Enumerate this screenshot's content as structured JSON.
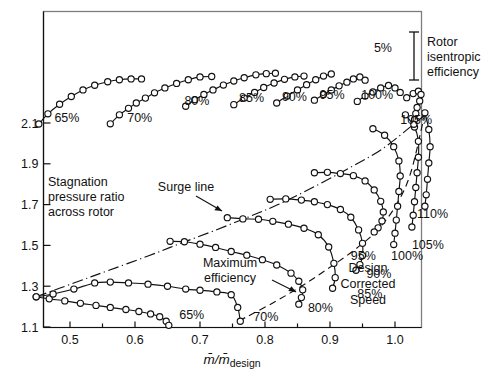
{
  "figure": {
    "xlabel": "m̄/m̄design",
    "xlabel_main": "m̄/m̄",
    "xlabel_sub": "design",
    "ylabel_line1": "Stagnation",
    "ylabel_line2": "pressure ratio",
    "ylabel_line3": "across rotor",
    "legend_line1": "Rotor",
    "legend_line2": "isentropic",
    "legend_line3": "efficiency",
    "eff_scale_label": "5%",
    "surge_label": "Surge line",
    "maxeff_line1": "Maximum",
    "maxeff_line2": "efficiency",
    "design_line1": "Design",
    "design_line2": "Corrected",
    "design_line3": "Speed"
  },
  "chart_data": {
    "type": "line",
    "xlabel": "m̄/m̄design",
    "ylabel": "Stagnation pressure ratio across rotor",
    "xlim": [
      0.44,
      1.06
    ],
    "ylim": [
      1.1,
      2.2
    ],
    "xticks": [
      0.5,
      0.6,
      0.7,
      0.8,
      0.9,
      1.0
    ],
    "xtick_labels": [
      "0.5",
      "0.6",
      "0.7",
      "0.8",
      "0.9",
      "1.0"
    ],
    "xminorticks": [
      0.45,
      0.55,
      0.65,
      0.75,
      0.85,
      0.95,
      1.05
    ],
    "yticks": [
      1.1,
      1.3,
      1.5,
      1.7,
      1.9,
      2.1
    ],
    "ytick_labels": [
      "1.1",
      "1.3",
      "1.5",
      "1.7",
      "1.9",
      "2.1"
    ],
    "grid": false,
    "legend_position": "top-right",
    "speed_lines": [
      {
        "name": "65%",
        "label": "65%",
        "label_xy": [
          0.668,
          1.138
        ],
        "x": [
          0.448,
          0.468,
          0.492,
          0.516,
          0.54,
          0.562,
          0.586,
          0.606,
          0.624,
          0.638,
          0.648,
          0.652
        ],
        "y": [
          1.248,
          1.238,
          1.228,
          1.216,
          1.206,
          1.196,
          1.186,
          1.176,
          1.164,
          1.15,
          1.128,
          1.108
        ]
      },
      {
        "name": "70%",
        "label": "70%",
        "label_xy": [
          0.782,
          1.132
        ],
        "x": [
          0.448,
          0.474,
          0.506,
          0.538,
          0.562,
          0.59,
          0.62,
          0.65,
          0.678,
          0.7,
          0.726,
          0.748,
          0.758,
          0.762
        ],
        "y": [
          1.248,
          1.262,
          1.286,
          1.316,
          1.32,
          1.316,
          1.31,
          1.3,
          1.286,
          1.28,
          1.272,
          1.258,
          1.196,
          1.128
        ]
      },
      {
        "name": "80%",
        "label": "80%",
        "label_xy": [
          0.866,
          1.176
        ],
        "x": [
          0.654,
          0.676,
          0.7,
          0.724,
          0.748,
          0.772,
          0.796,
          0.818,
          0.84,
          0.852,
          0.858,
          0.856,
          0.852
        ],
        "y": [
          1.52,
          1.518,
          1.506,
          1.49,
          1.47,
          1.452,
          1.43,
          1.404,
          1.364,
          1.324,
          1.282,
          1.244,
          1.212
        ]
      },
      {
        "name": "85%",
        "label": "85%",
        "label_xy": [
          0.942,
          1.244
        ],
        "x": [
          0.742,
          0.766,
          0.79,
          0.812,
          0.836,
          0.86,
          0.882,
          0.898,
          0.906,
          0.908,
          0.904
        ],
        "y": [
          1.636,
          1.63,
          1.628,
          1.618,
          1.604,
          1.584,
          1.552,
          1.492,
          1.412,
          1.342,
          1.29
        ]
      },
      {
        "name": "90%",
        "label": "90%",
        "label_xy": [
          0.956,
          1.338
        ],
        "x": [
          0.808,
          0.832,
          0.856,
          0.876,
          0.896,
          0.916,
          0.932,
          0.944,
          0.95,
          0.95,
          0.946,
          0.94
        ],
        "y": [
          1.726,
          1.728,
          1.722,
          1.714,
          1.7,
          1.676,
          1.638,
          1.576,
          1.51,
          1.45,
          1.406,
          1.378
        ]
      },
      {
        "name": "95%",
        "label": "95%",
        "label_xy": [
          0.932,
          1.428
        ],
        "x": [
          0.876,
          0.896,
          0.916,
          0.936,
          0.954,
          0.968,
          0.978,
          0.982,
          0.98,
          0.974,
          0.968
        ],
        "y": [
          1.856,
          1.858,
          1.852,
          1.842,
          1.816,
          1.772,
          1.716,
          1.664,
          1.62,
          1.586,
          1.566
        ]
      },
      {
        "name": "100%",
        "label": "100%",
        "label_xy": [
          0.994,
          1.43
        ],
        "x": [
          0.966,
          0.984,
          0.998,
          1.006,
          1.008,
          1.006,
          1.004,
          1.002,
          1.0,
          0.998
        ],
        "y": [
          2.072,
          2.04,
          1.984,
          1.914,
          1.84,
          1.764,
          1.692,
          1.624,
          1.56,
          1.504
        ]
      },
      {
        "name": "105%",
        "label": "105%",
        "label_xy": [
          1.026,
          1.482
        ],
        "x": [
          1.016,
          1.03,
          1.036,
          1.036,
          1.034,
          1.032,
          1.03,
          1.028,
          1.026
        ],
        "y": [
          2.14,
          2.08,
          2.01,
          1.932,
          1.856,
          1.784,
          1.714,
          1.648,
          1.59
        ]
      },
      {
        "name": "110%",
        "label": "110%",
        "label_xy": [
          1.034,
          1.636
        ],
        "x": [
          1.046,
          1.052,
          1.054,
          1.052,
          1.05,
          1.048,
          1.046
        ],
        "y": [
          2.15,
          2.068,
          1.984,
          1.904,
          1.824,
          1.748,
          1.692
        ]
      }
    ],
    "efficiency_lines": [
      {
        "name": "65%",
        "label": "65%",
        "label_xy": [
          0.476,
          2.106
        ],
        "x": [
          0.452,
          0.466,
          0.484,
          0.502,
          0.52,
          0.538,
          0.558,
          0.576,
          0.594,
          0.61
        ],
        "y": [
          2.095,
          2.145,
          2.192,
          2.23,
          2.262,
          2.285,
          2.302,
          2.312,
          2.316,
          2.316
        ]
      },
      {
        "name": "70%",
        "label": "70%",
        "label_xy": [
          0.588,
          2.105
        ],
        "x": [
          0.562,
          0.576,
          0.59,
          0.602,
          0.616,
          0.63,
          0.646,
          0.664,
          0.682,
          0.7,
          0.718
        ],
        "y": [
          2.096,
          2.14,
          2.172,
          2.198,
          2.222,
          2.248,
          2.272,
          2.294,
          2.312,
          2.326,
          2.328
        ]
      },
      {
        "name": "80%",
        "label": "80%",
        "label_xy": [
          0.676,
          2.19
        ],
        "x": [
          0.678,
          0.692,
          0.706,
          0.72,
          0.736,
          0.752,
          0.768,
          0.786,
          0.802,
          0.816
        ],
        "y": [
          2.182,
          2.214,
          2.24,
          2.262,
          2.286,
          2.306,
          2.322,
          2.336,
          2.342,
          2.344
        ]
      },
      {
        "name": "85%",
        "label": "85%",
        "label_xy": [
          0.76,
          2.202
        ],
        "x": [
          0.752,
          0.768,
          0.784,
          0.798,
          0.814,
          0.83,
          0.846,
          0.86
        ],
        "y": [
          2.19,
          2.222,
          2.25,
          2.274,
          2.296,
          2.314,
          2.326,
          2.33
        ]
      },
      {
        "name": "90%",
        "label": "90%",
        "label_xy": [
          0.826,
          2.21
        ],
        "x": [
          0.818,
          0.834,
          0.85,
          0.864,
          0.878,
          0.89,
          0.902
        ],
        "y": [
          2.198,
          2.232,
          2.262,
          2.288,
          2.312,
          2.33,
          2.34
        ]
      },
      {
        "name": "95%",
        "label": "95%",
        "label_xy": [
          0.884,
          2.22
        ],
        "x": [
          0.876,
          0.89,
          0.902,
          0.914,
          0.926,
          0.936,
          0.946,
          0.954
        ],
        "y": [
          2.212,
          2.24,
          2.262,
          2.282,
          2.3,
          2.316,
          2.326,
          2.31
        ]
      },
      {
        "name": "100%",
        "label": "100%",
        "label_xy": [
          0.948,
          2.22
        ],
        "x": [
          0.942,
          0.954,
          0.966,
          0.978,
          0.99,
          1.0,
          1.008
        ],
        "y": [
          2.206,
          2.232,
          2.252,
          2.272,
          2.284,
          2.272,
          2.25
        ]
      },
      {
        "name": "105%",
        "label": "105%",
        "label_xy": [
          1.008,
          2.096
        ],
        "x": [
          1.018,
          1.028,
          1.036,
          1.04,
          1.038,
          1.034,
          1.032,
          1.03,
          1.029
        ],
        "y": [
          2.224,
          2.244,
          2.256,
          2.24,
          2.208,
          2.176,
          2.146,
          2.116,
          2.094
        ]
      }
    ],
    "surge_line": {
      "name": "Surge line",
      "style": "dash-dot",
      "x": [
        0.448,
        0.508,
        0.56,
        0.62,
        0.67,
        0.72,
        0.772,
        0.82,
        0.876,
        0.93,
        0.98,
        1.028,
        1.05
      ],
      "y": [
        1.248,
        1.318,
        1.378,
        1.448,
        1.51,
        1.57,
        1.636,
        1.7,
        1.788,
        1.88,
        1.972,
        2.092,
        2.15
      ]
    },
    "max_efficiency_line": {
      "name": "Maximum efficiency",
      "style": "dashed",
      "x": [
        0.76,
        0.812,
        0.856,
        0.896,
        0.936,
        0.97,
        1.0,
        1.024,
        1.046
      ],
      "y": [
        1.13,
        1.218,
        1.3,
        1.384,
        1.474,
        1.566,
        1.688,
        1.854,
        2.148
      ]
    },
    "efficiency_scale": {
      "label": "5%",
      "delta_pressure_units": 0.16,
      "top_y": 2.272,
      "bottom_y": 2.112
    }
  }
}
